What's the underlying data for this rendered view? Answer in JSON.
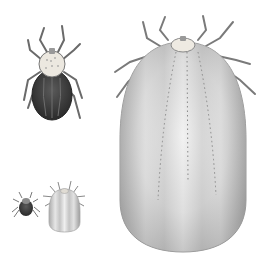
{
  "image": {
    "subject": "Scientific illustration of ticks: unfed adult and fully engorged forms",
    "background": "#ffffff",
    "figures": [
      {
        "name": "unfed-adult-tick",
        "position": "top-left",
        "shield_color": "#e8e4dc",
        "body_color": "#3a3a3a"
      },
      {
        "name": "engorged-large-tick",
        "position": "right",
        "body_color": "#cfcfcf"
      },
      {
        "name": "small-unfed-tick",
        "position": "bottom-left",
        "body_color": "#3c3c3c"
      },
      {
        "name": "small-engorged-tick",
        "position": "bottom-left-center",
        "body_color": "#c8c8c8"
      }
    ]
  }
}
